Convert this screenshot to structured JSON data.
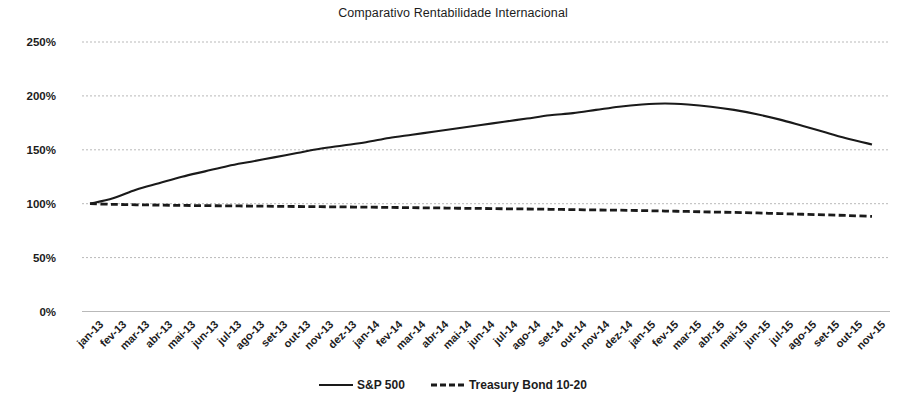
{
  "chart_data": {
    "type": "line",
    "title": "Comparativo Rentabilidade Internacional",
    "xlabel": "",
    "ylabel": "",
    "ylim": [
      0,
      250
    ],
    "ytick_labels": [
      "0%",
      "50%",
      "100%",
      "150%",
      "200%",
      "250%"
    ],
    "ytick_values": [
      0,
      50,
      100,
      150,
      200,
      250
    ],
    "grid": true,
    "grid_style": "dotted-horizontal",
    "legend_position": "bottom-center",
    "categories": [
      "jan-13",
      "fev-13",
      "mar-13",
      "abr-13",
      "mai-13",
      "jun-13",
      "jul-13",
      "ago-13",
      "set-13",
      "out-13",
      "nov-13",
      "dez-13",
      "jan-14",
      "fev-14",
      "mar-14",
      "abr-14",
      "mai-14",
      "jun-14",
      "jul-14",
      "ago-14",
      "set-14",
      "out-14",
      "nov-14",
      "dez-14",
      "jan-15",
      "fev-15",
      "mar-15",
      "abr-15",
      "mai-15",
      "jun-15",
      "jul-15",
      "ago-15",
      "set-15",
      "out-15",
      "nov-15"
    ],
    "series": [
      {
        "name": "S&P 500",
        "style": "solid",
        "color": "#1a1a1a",
        "values": [
          100,
          105,
          113,
          119,
          125,
          130,
          135,
          139,
          143,
          147,
          151,
          154,
          157,
          161,
          164,
          167,
          170,
          173,
          176,
          179,
          182,
          184,
          187,
          190,
          192,
          193,
          192,
          190,
          187,
          183,
          178,
          172,
          166,
          160,
          155
        ]
      },
      {
        "name": "Treasury Bond 10-20",
        "style": "dashed",
        "color": "#1a1a1a",
        "values": [
          100,
          99.4,
          99.0,
          98.7,
          98.4,
          98.2,
          98.0,
          97.8,
          97.6,
          97.4,
          97.2,
          97.0,
          96.8,
          96.6,
          96.3,
          96.1,
          95.8,
          95.6,
          95.3,
          95.1,
          94.8,
          94.5,
          94.2,
          94.0,
          93.6,
          93.2,
          92.8,
          92.3,
          91.9,
          91.4,
          90.8,
          90.2,
          89.6,
          89.0,
          88.2
        ]
      }
    ],
    "legend": [
      {
        "label": "S&P 500",
        "style": "solid"
      },
      {
        "label": "Treasury Bond 10-20",
        "style": "dashed"
      }
    ]
  }
}
